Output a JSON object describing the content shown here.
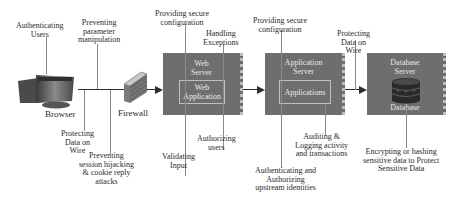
{
  "diagram": {
    "nodes": {
      "browser": {
        "label": "Browser"
      },
      "firewall": {
        "label": "Firewall"
      },
      "web_server": {
        "title": "Web\nServer",
        "inner": "Web\nApplication"
      },
      "app_server": {
        "title": "Application\nServer",
        "inner": "Applications"
      },
      "db_server": {
        "title": "Database\nServer",
        "inner": "Database"
      }
    },
    "annotations": {
      "authenticating_users": "Authenticating\nUsers",
      "preventing_param": "Preventing\nparameter\nmanipulation",
      "protecting_wire_1": "Protecting\nData on\nWire",
      "preventing_session": "Preventing\nsession hijacking\n& cookie reply\nattacks",
      "providing_config_1": "Providing secure\nconfiguration",
      "handling_exceptions": "Handling\nExceptions",
      "validating_input": "Validating\nInput",
      "authorizing_users": "Authorizing\nusers",
      "providing_config_2": "Providing secure\nconfiguration",
      "auditing": "Auditing &\nLogging activity\nand transactions",
      "auth_upstream": "Authenticating and\nAuthorizing\nupstream identities",
      "protecting_wire_2": "Protecting\nData on\nWire",
      "encrypting": "Encrypting or hashing\nsensitive data to Protect\nSensitive Data"
    },
    "colors": {
      "server_fill": "#6e6e6e",
      "line": "#2e2e2e",
      "leader": "#8a8a8a"
    }
  }
}
